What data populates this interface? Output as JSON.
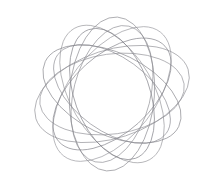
{
  "canvas": {
    "width": 223,
    "height": 188,
    "background_color": "#ffffff",
    "title": "Spirograph Rosette"
  },
  "artwork": {
    "name": "nested-rotated-ellipse-rosette",
    "description": "A family of ten congruent ellipses sharing a common center, each rotated by a fixed angular increment, forming a five-lobed rose figure.",
    "lobe_count": 5,
    "stroke_color_light": "#b9b9bd",
    "stroke_color_dark": "#5a5a60",
    "stroke_width": 0.85,
    "stroke_opacity": 0.82,
    "center_x": 112,
    "center_y": 94,
    "radius_x": 80,
    "radius_y": 44,
    "base_rotation": -18,
    "rotation_step": 146,
    "strand_count": 10,
    "scale_step": 0.018,
    "bounds": {
      "left": 20,
      "top": 14,
      "right": 205,
      "bottom": 172
    },
    "strands": [
      {
        "index": 0,
        "rotation": -18,
        "scale": 1.0,
        "color": "#8e8e94",
        "opacity": 0.8,
        "width": 0.85
      },
      {
        "index": 1,
        "rotation": 128,
        "scale": 0.982,
        "color": "#97979d",
        "opacity": 0.8,
        "width": 0.85
      },
      {
        "index": 2,
        "rotation": 274,
        "scale": 0.964,
        "color": "#8a8a90",
        "opacity": 0.82,
        "width": 0.85
      },
      {
        "index": 3,
        "rotation": 420,
        "scale": 0.946,
        "color": "#949499",
        "opacity": 0.8,
        "width": 0.85
      },
      {
        "index": 4,
        "rotation": 566,
        "scale": 0.928,
        "color": "#86868c",
        "opacity": 0.82,
        "width": 0.85
      },
      {
        "index": 5,
        "rotation": 712,
        "scale": 0.91,
        "color": "#909096",
        "opacity": 0.8,
        "width": 0.85
      },
      {
        "index": 6,
        "rotation": 858,
        "scale": 0.892,
        "color": "#83838a",
        "opacity": 0.82,
        "width": 0.85
      },
      {
        "index": 7,
        "rotation": 1004,
        "scale": 0.874,
        "color": "#8d8d93",
        "opacity": 0.8,
        "width": 0.85
      },
      {
        "index": 8,
        "rotation": 1150,
        "scale": 0.856,
        "color": "#7f7f86",
        "opacity": 0.82,
        "width": 0.85
      },
      {
        "index": 9,
        "rotation": 1296,
        "scale": 0.838,
        "color": "#8a8a91",
        "opacity": 0.8,
        "width": 0.85
      }
    ]
  }
}
